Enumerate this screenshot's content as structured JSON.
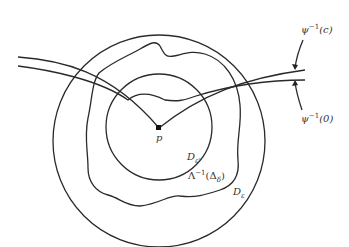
{
  "diagram": {
    "labels": {
      "psi_c": {
        "base": "ψ",
        "sup": "−1",
        "arg": "(c)"
      },
      "psi_0": {
        "base": "ψ",
        "sup": "−1",
        "arg": "(0)"
      },
      "p": "p",
      "d_eps_prime": {
        "base": "D",
        "sub": "ε'"
      },
      "lambda": {
        "base": "Λ",
        "sup": "−1",
        "arg_open": "(Δ",
        "sub": "δ",
        "arg_close": ")"
      },
      "d_eps": {
        "base": "D",
        "sub": "ε"
      }
    },
    "colors": {
      "stroke": "#2a2a2a",
      "background": "#ffffff"
    }
  }
}
